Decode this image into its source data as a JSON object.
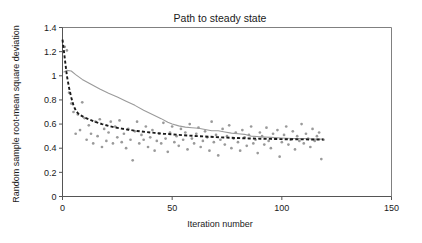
{
  "chart_data": {
    "type": "scatter",
    "title": "Path to steady state",
    "xlabel": "Iteration number",
    "ylabel": "Random sample root-mean square deviation",
    "xlim": [
      0,
      150
    ],
    "ylim": [
      0,
      1.4
    ],
    "xticks": [
      0,
      50,
      100,
      150
    ],
    "xtick_labels": [
      "0",
      "50",
      "100",
      "150"
    ],
    "yticks": [
      0,
      0.2,
      0.4,
      0.6,
      0.8,
      1.0,
      1.2,
      1.4
    ],
    "ytick_labels": [
      "0",
      "0.2",
      "0.4",
      "0.6",
      "0.8",
      "1",
      "1.2",
      "1.4"
    ],
    "grid": false,
    "legend": "none",
    "colors": {
      "scatter": "#9a9a9a",
      "gray_line": "#9a9a9a",
      "dashed_line": "#1a1a1a",
      "axis": "#555555"
    },
    "series": [
      {
        "name": "Random sample RMSD (scatter)",
        "type": "scatter",
        "marker": "circle",
        "color": "#9a9a9a",
        "points": [
          [
            1,
            1.24
          ],
          [
            2,
            1.21
          ],
          [
            3,
            0.86
          ],
          [
            4,
            0.77
          ],
          [
            5,
            0.7
          ],
          [
            6,
            0.52
          ],
          [
            7,
            0.68
          ],
          [
            8,
            0.55
          ],
          [
            9,
            0.78
          ],
          [
            10,
            0.65
          ],
          [
            11,
            0.47
          ],
          [
            12,
            0.59
          ],
          [
            13,
            0.52
          ],
          [
            14,
            0.44
          ],
          [
            15,
            0.62
          ],
          [
            16,
            0.5
          ],
          [
            17,
            0.64
          ],
          [
            18,
            0.41
          ],
          [
            19,
            0.56
          ],
          [
            20,
            0.46
          ],
          [
            21,
            0.53
          ],
          [
            22,
            0.62
          ],
          [
            23,
            0.44
          ],
          [
            24,
            0.58
          ],
          [
            25,
            0.49
          ],
          [
            26,
            0.63
          ],
          [
            27,
            0.45
          ],
          [
            28,
            0.52
          ],
          [
            29,
            0.4
          ],
          [
            30,
            0.56
          ],
          [
            31,
            0.47
          ],
          [
            32,
            0.3
          ],
          [
            33,
            0.54
          ],
          [
            34,
            0.62
          ],
          [
            35,
            0.44
          ],
          [
            36,
            0.51
          ],
          [
            37,
            0.47
          ],
          [
            38,
            0.58
          ],
          [
            39,
            0.41
          ],
          [
            40,
            0.49
          ],
          [
            41,
            0.55
          ],
          [
            42,
            0.38
          ],
          [
            43,
            0.46
          ],
          [
            44,
            0.52
          ],
          [
            45,
            0.44
          ],
          [
            46,
            0.61
          ],
          [
            47,
            0.48
          ],
          [
            48,
            0.37
          ],
          [
            49,
            0.53
          ],
          [
            50,
            0.58
          ],
          [
            51,
            0.45
          ],
          [
            52,
            0.5
          ],
          [
            53,
            0.42
          ],
          [
            54,
            0.56
          ],
          [
            55,
            0.47
          ],
          [
            56,
            0.53
          ],
          [
            57,
            0.39
          ],
          [
            58,
            0.6
          ],
          [
            59,
            0.48
          ],
          [
            60,
            0.44
          ],
          [
            61,
            0.52
          ],
          [
            62,
            0.57
          ],
          [
            63,
            0.41
          ],
          [
            64,
            0.46
          ],
          [
            65,
            0.54
          ],
          [
            66,
            0.49
          ],
          [
            67,
            0.38
          ],
          [
            68,
            0.62
          ],
          [
            69,
            0.45
          ],
          [
            70,
            0.51
          ],
          [
            71,
            0.34
          ],
          [
            72,
            0.47
          ],
          [
            73,
            0.56
          ],
          [
            74,
            0.43
          ],
          [
            75,
            0.5
          ],
          [
            76,
            0.59
          ],
          [
            77,
            0.4
          ],
          [
            78,
            0.48
          ],
          [
            79,
            0.53
          ],
          [
            80,
            0.45
          ],
          [
            81,
            0.38
          ],
          [
            82,
            0.55
          ],
          [
            83,
            0.49
          ],
          [
            84,
            0.42
          ],
          [
            85,
            0.51
          ],
          [
            86,
            0.58
          ],
          [
            87,
            0.44
          ],
          [
            88,
            0.47
          ],
          [
            89,
            0.36
          ],
          [
            90,
            0.53
          ],
          [
            91,
            0.5
          ],
          [
            92,
            0.43
          ],
          [
            93,
            0.57
          ],
          [
            94,
            0.46
          ],
          [
            95,
            0.4
          ],
          [
            96,
            0.52
          ],
          [
            97,
            0.48
          ],
          [
            98,
            0.55
          ],
          [
            99,
            0.33
          ],
          [
            100,
            0.45
          ],
          [
            101,
            0.51
          ],
          [
            102,
            0.58
          ],
          [
            103,
            0.43
          ],
          [
            104,
            0.47
          ],
          [
            105,
            0.54
          ],
          [
            106,
            0.39
          ],
          [
            107,
            0.5
          ],
          [
            108,
            0.46
          ],
          [
            109,
            0.6
          ],
          [
            110,
            0.44
          ],
          [
            111,
            0.52
          ],
          [
            112,
            0.48
          ],
          [
            113,
            0.41
          ],
          [
            114,
            0.56
          ],
          [
            115,
            0.46
          ],
          [
            116,
            0.5
          ],
          [
            117,
            0.53
          ],
          [
            118,
            0.31
          ],
          [
            119,
            0.47
          ]
        ]
      },
      {
        "name": "Gray running curve",
        "type": "line",
        "style": "solid",
        "color": "#9a9a9a",
        "points": [
          [
            0.5,
            1.03
          ],
          [
            2,
            1.045
          ],
          [
            4,
            1.04
          ],
          [
            6,
            1.01
          ],
          [
            9,
            0.97
          ],
          [
            13,
            0.93
          ],
          [
            17,
            0.89
          ],
          [
            21,
            0.855
          ],
          [
            25,
            0.825
          ],
          [
            29,
            0.79
          ],
          [
            33,
            0.755
          ],
          [
            37,
            0.715
          ],
          [
            41,
            0.68
          ],
          [
            45,
            0.645
          ],
          [
            48,
            0.615
          ],
          [
            50,
            0.6
          ],
          [
            53,
            0.585
          ],
          [
            56,
            0.575
          ],
          [
            59,
            0.57
          ],
          [
            62,
            0.565
          ],
          [
            65,
            0.555
          ],
          [
            68,
            0.545
          ],
          [
            71,
            0.545
          ],
          [
            74,
            0.535
          ],
          [
            77,
            0.525
          ],
          [
            80,
            0.52
          ],
          [
            83,
            0.515
          ],
          [
            86,
            0.5
          ],
          [
            90,
            0.495
          ],
          [
            95,
            0.49
          ],
          [
            100,
            0.485
          ],
          [
            105,
            0.48
          ],
          [
            110,
            0.48
          ],
          [
            115,
            0.475
          ],
          [
            119,
            0.475
          ]
        ]
      },
      {
        "name": "Dashed fitted curve",
        "type": "line",
        "style": "dashed",
        "color": "#1a1a1a",
        "points": [
          [
            0,
            1.3
          ],
          [
            0.6,
            1.21
          ],
          [
            1.2,
            1.12
          ],
          [
            2,
            1.0
          ],
          [
            3,
            0.9
          ],
          [
            4,
            0.82
          ],
          [
            5,
            0.755
          ],
          [
            6,
            0.715
          ],
          [
            7,
            0.69
          ],
          [
            8,
            0.675
          ],
          [
            10,
            0.655
          ],
          [
            12,
            0.64
          ],
          [
            14,
            0.625
          ],
          [
            16,
            0.612
          ],
          [
            18,
            0.6
          ],
          [
            21,
            0.585
          ],
          [
            24,
            0.572
          ],
          [
            27,
            0.562
          ],
          [
            30,
            0.553
          ],
          [
            34,
            0.543
          ],
          [
            38,
            0.534
          ],
          [
            42,
            0.527
          ],
          [
            46,
            0.52
          ],
          [
            50,
            0.515
          ],
          [
            55,
            0.508
          ],
          [
            60,
            0.502
          ],
          [
            65,
            0.497
          ],
          [
            70,
            0.492
          ],
          [
            75,
            0.488
          ],
          [
            80,
            0.484
          ],
          [
            85,
            0.481
          ],
          [
            90,
            0.479
          ],
          [
            95,
            0.477
          ],
          [
            100,
            0.475
          ],
          [
            105,
            0.474
          ],
          [
            110,
            0.473
          ],
          [
            115,
            0.472
          ],
          [
            119,
            0.472
          ]
        ]
      }
    ]
  }
}
